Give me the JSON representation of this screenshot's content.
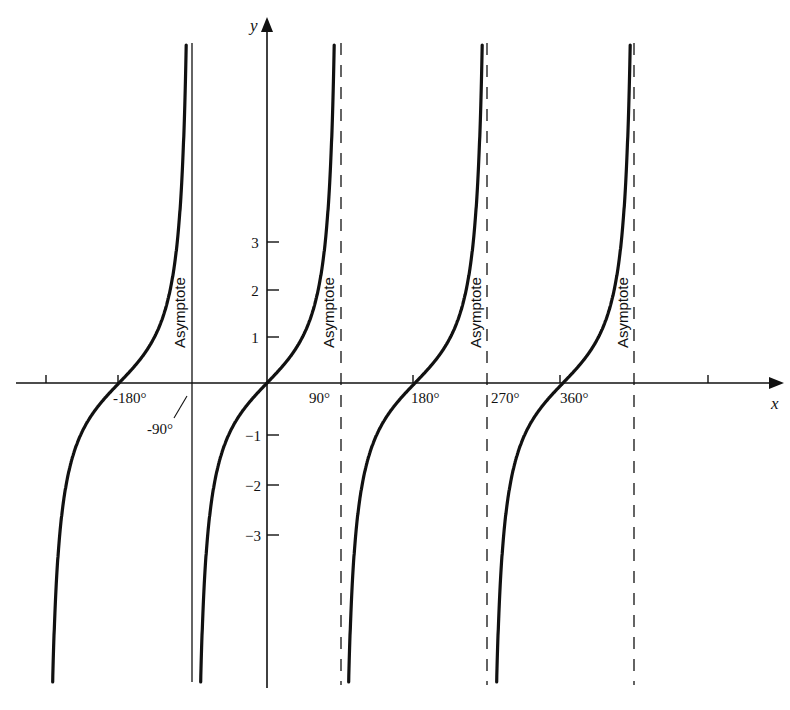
{
  "chart_data": {
    "type": "line",
    "title": "",
    "function": "y = tan x",
    "xlabel": "x",
    "ylabel": "y",
    "x_unit": "degrees",
    "xlim": [
      -300,
      560
    ],
    "ylim": [
      -6.2,
      7.3
    ],
    "grid": false,
    "legend": null,
    "x_ticks": [
      -270,
      -180,
      -90,
      0,
      90,
      180,
      270,
      360,
      450,
      540
    ],
    "x_tick_labels": [
      {
        "value": -180,
        "label": "-180°"
      },
      {
        "value": -90,
        "label": "-90°"
      },
      {
        "value": 90,
        "label": "90°"
      },
      {
        "value": 180,
        "label": "180°"
      },
      {
        "value": 270,
        "label": "270°"
      },
      {
        "value": 360,
        "label": "360°"
      }
    ],
    "y_ticks": [
      -3,
      -2,
      -1,
      1,
      2,
      3
    ],
    "y_tick_labels": [
      "-3",
      "-2",
      "-1",
      "1",
      "2",
      "3"
    ],
    "asymptotes": [
      {
        "x": -90,
        "style": "solid",
        "label": "Asymptote"
      },
      {
        "x": 90,
        "style": "dashed",
        "label": "Asymptote"
      },
      {
        "x": 270,
        "style": "dashed",
        "label": "Asymptote"
      },
      {
        "x": 450,
        "style": "dashed",
        "label": "Asymptote"
      }
    ],
    "branches": [
      {
        "interval": [
          -270,
          -90
        ],
        "zero": -180
      },
      {
        "interval": [
          -90,
          90
        ],
        "zero": 0
      },
      {
        "interval": [
          90,
          270
        ],
        "zero": 180
      },
      {
        "interval": [
          270,
          450
        ],
        "zero": 360
      }
    ],
    "series": [
      {
        "name": "tan x",
        "points_sample": [
          {
            "x": -180,
            "y": 0
          },
          {
            "x": -135,
            "y": 1
          },
          {
            "x": -225,
            "y": -1
          },
          {
            "x": 0,
            "y": 0
          },
          {
            "x": 45,
            "y": 1
          },
          {
            "x": -45,
            "y": -1
          },
          {
            "x": 180,
            "y": 0
          },
          {
            "x": 225,
            "y": 1
          },
          {
            "x": 135,
            "y": -1
          },
          {
            "x": 360,
            "y": 0
          },
          {
            "x": 405,
            "y": 1
          },
          {
            "x": 315,
            "y": -1
          }
        ]
      }
    ]
  },
  "labels": {
    "x_axis": "x",
    "y_axis": "y",
    "asymptote": "Asymptote",
    "x_neg180": "-180°",
    "x_neg90": "-90°",
    "x_90": "90°",
    "x_180": "180°",
    "x_270": "270°",
    "x_360": "360°",
    "y_1": "1",
    "y_2": "2",
    "y_3": "3",
    "y_neg1": "−1",
    "y_neg2": "−2",
    "y_neg3": "−3"
  },
  "colors": {
    "ink": "#111111",
    "background": "#ffffff"
  }
}
